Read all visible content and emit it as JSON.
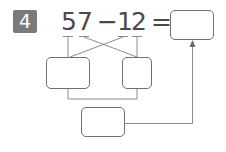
{
  "problem": {
    "number": "4",
    "expression": {
      "d1": "5",
      "d2": "7",
      "op": "−",
      "d3": "1",
      "d4": "2",
      "eq": "="
    }
  },
  "boxes": {
    "answer": "",
    "left_partial": "",
    "right_partial": "",
    "bottom_partial": ""
  },
  "colors": {
    "badge": "#7a7a7a",
    "text": "#4a4a4a",
    "lines": "#8c8c8c",
    "box_border": "#707070"
  }
}
